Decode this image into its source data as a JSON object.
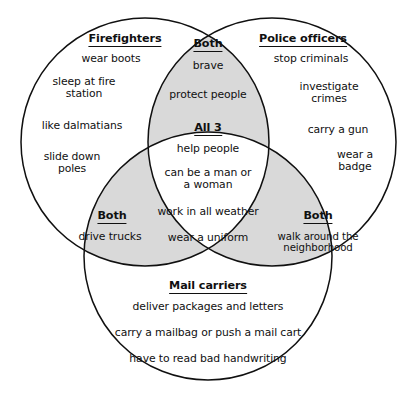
{
  "diagram": {
    "type": "venn",
    "set_count": 3,
    "colors": {
      "stroke": "#101010",
      "overlap_fill": "#d9d9d9",
      "background": "#ffffff",
      "text": "#101010"
    },
    "sets": [
      {
        "id": "firefighters",
        "label": "Firefighters",
        "position": "left",
        "items": [
          "wear boots",
          "sleep at fire\nstation",
          "like dalmatians",
          "slide down\npoles"
        ]
      },
      {
        "id": "police-officers",
        "label": "Police officers",
        "position": "right",
        "items": [
          "stop criminals",
          "investigate\ncrimes",
          "carry a gun",
          "wear a badge"
        ]
      },
      {
        "id": "mail-carriers",
        "label": "Mail carriers",
        "position": "bottom",
        "items": [
          "deliver packages and letters",
          "carry a mailbag or push a mail cart",
          "have to read bad handwriting"
        ]
      }
    ],
    "intersections": [
      {
        "id": "firefighters-police",
        "label": "Both",
        "position": "top",
        "items": [
          "brave",
          "protect people"
        ]
      },
      {
        "id": "firefighters-mail",
        "label": "Both",
        "position": "bottom-left",
        "items": [
          "drive trucks"
        ]
      },
      {
        "id": "police-mail",
        "label": "Both",
        "position": "bottom-right",
        "items": [
          "walk around the\nneighborhood"
        ]
      },
      {
        "id": "all-three",
        "label": "All 3",
        "position": "center",
        "items": [
          "help people",
          "can be a man or\na woman",
          "work in all weather",
          "wear a uniform"
        ]
      }
    ]
  }
}
